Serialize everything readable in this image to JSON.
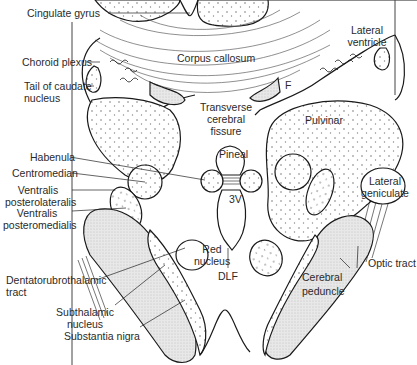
{
  "figure": {
    "type": "anatomical-diagram"
  },
  "labels": {
    "cingulate_gyrus": "Cingulate gyrus",
    "corpus_callosum": "Corpus callosum",
    "lateral_ventricle_1": "Lateral",
    "lateral_ventricle_2": "ventricle",
    "choroid_plexus": "Choroid plexus",
    "tail_caudate_1": "Tail of caudate",
    "tail_caudate_2": "nucleus",
    "fornix": "F",
    "transverse_1": "Transverse",
    "transverse_2": "cerebral",
    "transverse_3": "fissure",
    "pulvinar": "Pulvinar",
    "pineal": "Pineal",
    "habenula": "Habenula",
    "centromedian": "Centromedian",
    "vpl_1": "Ventralis",
    "vpl_2": "posterolateralis",
    "vpm_1": "Ventralis",
    "vpm_2": "posteromedialis",
    "third_ventricle": "3V",
    "lateral_geniculate_1": "Lateral",
    "lateral_geniculate_2": "geniculate",
    "red_nucleus_1": "Red",
    "red_nucleus_2": "nucleus",
    "dlf": "DLF",
    "optic_tract": "Optic tract",
    "cerebral_peduncle_1": "Cerebral",
    "cerebral_peduncle_2": "peduncle",
    "dentatorubrothalamic_1": "Dentatorubrothalamic",
    "dentatorubrothalamic_2": "tract",
    "subthalamic_1": "Subthalamic",
    "subthalamic_2": "nucleus",
    "substantia_nigra": "Substantia nigra"
  },
  "colors": {
    "outline": "#1a1a1a",
    "stipple_fill": "#e6e6e6",
    "background": "#ffffff",
    "text": "#2a2a2a"
  }
}
